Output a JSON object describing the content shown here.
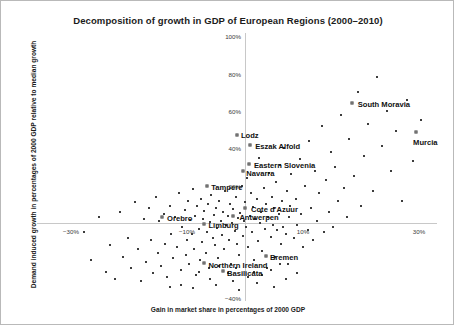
{
  "chart_data": {
    "type": "scatter",
    "title": "Decomposition of growth in GDP of European Regions (2000–2010)",
    "xlabel": "Gain in market share in percentages of 2000 GDP",
    "ylabel": "Demand induced growth in percentages of 2000 GDP relative to median growth",
    "xlim": [
      -32,
      32
    ],
    "ylim": [
      -42,
      102
    ],
    "grid": false,
    "legend_position": "none",
    "xticks": [
      -30,
      -10,
      10,
      30
    ],
    "xticklabels": [
      "−30%",
      "−10%",
      "10%",
      "30%"
    ],
    "yticks": [
      -40,
      20,
      40,
      60,
      80,
      100
    ],
    "yticklabels": [
      "−40%",
      "20%",
      "40%",
      "60%",
      "80%",
      "100%"
    ],
    "labeled_points": [
      {
        "label": "Lodz",
        "x": -1.4,
        "y": 47.0,
        "label_dx": 4,
        "label_dy": -4
      },
      {
        "label": "Eszak Alfold",
        "x": 0.9,
        "y": 42.0,
        "label_dx": 5,
        "label_dy": -3
      },
      {
        "label": "Eastern Slovenia",
        "x": 0.7,
        "y": 31.5,
        "label_dx": 5,
        "label_dy": -3
      },
      {
        "label": "Navarra",
        "x": -0.3,
        "y": 27.8,
        "label_dx": 3,
        "label_dy": -2
      },
      {
        "label": "South Moravia",
        "x": 18.4,
        "y": 64.3,
        "label_dx": 6,
        "label_dy": -3
      },
      {
        "label": "Murcia",
        "x": 29.5,
        "y": 48.7,
        "label_dx": -3,
        "label_dy": 6
      },
      {
        "label": "Tampere",
        "x": -6.5,
        "y": 19.8,
        "label_dx": 4,
        "label_dy": -3
      },
      {
        "label": "Cote d'Azuur",
        "x": 0.0,
        "y": 8.0,
        "label_dx": 6,
        "label_dy": -3
      },
      {
        "label": "Antwerpen",
        "x": -2.0,
        "y": 3.7,
        "label_dx": 6,
        "label_dy": -3
      },
      {
        "label": "Orebro",
        "x": -14.3,
        "y": 3.2,
        "label_dx": 5,
        "label_dy": -3
      },
      {
        "label": "Limburg",
        "x": -7.0,
        "y": -0.5,
        "label_dx": 4,
        "label_dy": 0
      },
      {
        "label": "Bremen",
        "x": 3.6,
        "y": -17.7,
        "label_dx": 4,
        "label_dy": -3
      },
      {
        "label": "Northern Ireland",
        "x": -7.0,
        "y": -21.5,
        "label_dx": 4,
        "label_dy": -2
      },
      {
        "label": "Basilicata",
        "x": -3.8,
        "y": -25.6,
        "label_dx": 4,
        "label_dy": -2
      }
    ],
    "points": [
      [
        -27.8,
        -5.0
      ],
      [
        -26.5,
        -20.0
      ],
      [
        -25.2,
        3.0
      ],
      [
        -24.0,
        -26.0
      ],
      [
        -23.2,
        -12.0
      ],
      [
        -22.4,
        -30.0
      ],
      [
        -21.6,
        6.0
      ],
      [
        -21.0,
        -18.0
      ],
      [
        -20.2,
        -8.0
      ],
      [
        -19.6,
        -24.0
      ],
      [
        -19.0,
        11.0
      ],
      [
        -18.4,
        -14.0
      ],
      [
        -18.0,
        -31.0
      ],
      [
        -17.4,
        2.0
      ],
      [
        -17.0,
        -21.0
      ],
      [
        -16.6,
        8.0
      ],
      [
        -16.2,
        -9.0
      ],
      [
        -15.8,
        -27.0
      ],
      [
        -15.4,
        14.0
      ],
      [
        -15.0,
        -16.0
      ],
      [
        -14.8,
        1.0
      ],
      [
        -14.4,
        -23.0
      ],
      [
        -14.0,
        5.0
      ],
      [
        -13.8,
        -11.0
      ],
      [
        -13.4,
        -29.0
      ],
      [
        -13.0,
        9.0
      ],
      [
        -12.8,
        -6.0
      ],
      [
        -12.4,
        -19.0
      ],
      [
        -12.0,
        3.0
      ],
      [
        -11.8,
        -13.0
      ],
      [
        -11.4,
        16.0
      ],
      [
        -11.0,
        -25.0
      ],
      [
        -10.8,
        -2.0
      ],
      [
        -10.4,
        7.0
      ],
      [
        -10.2,
        -17.0
      ],
      [
        -10.0,
        -9.0
      ],
      [
        -9.8,
        12.0
      ],
      [
        -9.6,
        -22.0
      ],
      [
        -9.4,
        1.5
      ],
      [
        -9.2,
        -6.0
      ],
      [
        -9.0,
        18.0
      ],
      [
        -8.8,
        -14.0
      ],
      [
        -8.6,
        4.0
      ],
      [
        -8.4,
        -28.0
      ],
      [
        -8.2,
        9.0
      ],
      [
        -8.0,
        -3.0
      ],
      [
        -7.8,
        -20.0
      ],
      [
        -7.6,
        13.0
      ],
      [
        -7.4,
        -10.0
      ],
      [
        -7.2,
        2.0
      ],
      [
        -7.0,
        6.5
      ],
      [
        -6.8,
        -16.0
      ],
      [
        -6.6,
        -5.0
      ],
      [
        -6.4,
        10.0
      ],
      [
        -6.2,
        -24.0
      ],
      [
        -6.0,
        0.5
      ],
      [
        -5.8,
        15.0
      ],
      [
        -5.6,
        -8.0
      ],
      [
        -5.4,
        4.5
      ],
      [
        -5.2,
        -12.0
      ],
      [
        -5.0,
        8.0
      ],
      [
        -4.8,
        -2.5
      ],
      [
        -4.6,
        -19.0
      ],
      [
        -4.4,
        12.0
      ],
      [
        -4.2,
        1.0
      ],
      [
        -4.0,
        -6.5
      ],
      [
        -3.8,
        6.0
      ],
      [
        -3.6,
        -14.0
      ],
      [
        -3.4,
        17.0
      ],
      [
        -3.2,
        -1.0
      ],
      [
        -3.0,
        3.5
      ],
      [
        -2.8,
        -9.0
      ],
      [
        -2.6,
        10.0
      ],
      [
        -2.4,
        -22.0
      ],
      [
        -2.2,
        0.0
      ],
      [
        -2.0,
        7.5
      ],
      [
        -1.8,
        -4.5
      ],
      [
        -1.6,
        14.0
      ],
      [
        -1.4,
        -11.0
      ],
      [
        -1.2,
        2.5
      ],
      [
        -1.0,
        -17.0
      ],
      [
        -0.8,
        5.5
      ],
      [
        -0.6,
        20.0
      ],
      [
        -0.4,
        -7.0
      ],
      [
        -0.2,
        1.0
      ],
      [
        0.0,
        11.0
      ],
      [
        0.2,
        -2.0
      ],
      [
        0.4,
        24.0
      ],
      [
        0.6,
        -13.0
      ],
      [
        0.8,
        4.0
      ],
      [
        1.0,
        16.0
      ],
      [
        1.2,
        -5.0
      ],
      [
        1.4,
        8.5
      ],
      [
        1.6,
        -20.0
      ],
      [
        1.8,
        2.0
      ],
      [
        2.0,
        13.0
      ],
      [
        2.2,
        -9.5
      ],
      [
        2.4,
        35.0
      ],
      [
        2.6,
        0.0
      ],
      [
        2.8,
        6.0
      ],
      [
        3.0,
        -15.0
      ],
      [
        3.2,
        19.0
      ],
      [
        3.4,
        -3.0
      ],
      [
        3.6,
        10.0
      ],
      [
        3.8,
        -24.0
      ],
      [
        4.0,
        3.0
      ],
      [
        4.2,
        27.0
      ],
      [
        4.4,
        -7.5
      ],
      [
        4.6,
        14.0
      ],
      [
        4.8,
        -1.0
      ],
      [
        5.0,
        8.0
      ],
      [
        5.2,
        -18.0
      ],
      [
        5.4,
        22.0
      ],
      [
        5.6,
        -4.0
      ],
      [
        5.8,
        5.0
      ],
      [
        6.0,
        31.0
      ],
      [
        6.2,
        -11.0
      ],
      [
        6.4,
        12.0
      ],
      [
        6.6,
        -2.0
      ],
      [
        6.8,
        40.0
      ],
      [
        7.0,
        -6.0
      ],
      [
        7.2,
        17.0
      ],
      [
        7.4,
        -22.0
      ],
      [
        7.6,
        3.0
      ],
      [
        7.8,
        9.0
      ],
      [
        8.0,
        26.0
      ],
      [
        8.4,
        -8.0
      ],
      [
        8.8,
        13.0
      ],
      [
        9.0,
        -1.0
      ],
      [
        9.4,
        34.0
      ],
      [
        9.6,
        5.0
      ],
      [
        10.0,
        -13.0
      ],
      [
        10.4,
        20.0
      ],
      [
        10.8,
        -4.0
      ],
      [
        11.0,
        44.0
      ],
      [
        11.4,
        8.0
      ],
      [
        11.8,
        -9.0
      ],
      [
        12.0,
        28.0
      ],
      [
        12.4,
        1.0
      ],
      [
        12.8,
        16.0
      ],
      [
        13.2,
        52.0
      ],
      [
        13.6,
        -5.0
      ],
      [
        14.0,
        23.0
      ],
      [
        14.4,
        6.0
      ],
      [
        14.8,
        38.0
      ],
      [
        15.2,
        -2.0
      ],
      [
        15.6,
        30.0
      ],
      [
        16.0,
        12.0
      ],
      [
        16.6,
        58.0
      ],
      [
        17.0,
        19.0
      ],
      [
        17.6,
        3.0
      ],
      [
        18.0,
        45.0
      ],
      [
        18.8,
        25.0
      ],
      [
        19.4,
        70.0
      ],
      [
        20.0,
        9.0
      ],
      [
        20.6,
        36.0
      ],
      [
        21.2,
        53.0
      ],
      [
        22.0,
        17.0
      ],
      [
        22.8,
        78.0
      ],
      [
        23.6,
        41.0
      ],
      [
        24.4,
        60.0
      ],
      [
        25.2,
        28.0
      ],
      [
        26.0,
        49.0
      ],
      [
        27.0,
        12.0
      ],
      [
        28.0,
        66.0
      ],
      [
        29.0,
        33.0
      ],
      [
        30.4,
        55.0
      ],
      [
        -13.0,
        -34.0
      ],
      [
        -9.0,
        -35.0
      ],
      [
        -5.0,
        -33.0
      ],
      [
        -1.0,
        -36.0
      ],
      [
        2.0,
        -32.0
      ],
      [
        5.0,
        -34.0
      ],
      [
        0.5,
        -29.0
      ],
      [
        -2.0,
        -31.0
      ],
      [
        3.0,
        -28.0
      ],
      [
        -6.0,
        -30.0
      ],
      [
        7.0,
        -30.0
      ],
      [
        -3.0,
        -27.0
      ],
      [
        1.5,
        -26.0
      ],
      [
        -8.0,
        -26.0
      ],
      [
        4.5,
        -25.0
      ],
      [
        -4.5,
        -23.0
      ],
      [
        9.0,
        -27.0
      ],
      [
        6.0,
        -22.0
      ],
      [
        -1.5,
        -24.0
      ],
      [
        -11.0,
        -33.0
      ]
    ]
  }
}
